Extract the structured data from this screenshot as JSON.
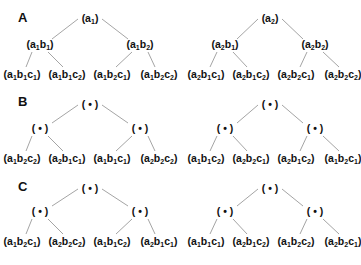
{
  "panels": [
    {
      "label": "A",
      "trees": [
        {
          "root": "(a1)",
          "mid": [
            "(a1b1)",
            "(a1b2)"
          ],
          "leaves": [
            "(a1b1c1)",
            "(a1b1c2)",
            "(a1b2c1)",
            "(a1b2c2)"
          ]
        },
        {
          "root": "(a2)",
          "mid": [
            "(a2b1)",
            "(a2b2)"
          ],
          "leaves": [
            "(a2b1c1)",
            "(a2b1c2)",
            "(a2b2c1)",
            "(a2b2c2)"
          ]
        }
      ]
    },
    {
      "label": "B",
      "trees": [
        {
          "root": "(•)",
          "mid": [
            "(•)",
            "(•)"
          ],
          "leaves": [
            "(a1b2c2)",
            "(a2b1c1)",
            "(a1b1c1)",
            "(a2b2c2)"
          ]
        },
        {
          "root": "(•)",
          "mid": [
            "(•)",
            "(•)"
          ],
          "leaves": [
            "(a1b1c2)",
            "(a2b2c1)",
            "(a2b1c2)",
            "(a1b2c1)"
          ]
        }
      ]
    },
    {
      "label": "C",
      "trees": [
        {
          "root": "(•)",
          "mid": [
            "(•)",
            "(•)"
          ],
          "leaves": [
            "(a1b2c1)",
            "(a2b2c2)",
            "(a1b1c2)",
            "(a2b1c1)"
          ]
        },
        {
          "root": "(•)",
          "mid": [
            "(•)",
            "(•)"
          ],
          "leaves": [
            "(a1b1c1)",
            "(a2b1c2)",
            "(a1b2c2)",
            "(a2b2c1)"
          ]
        }
      ]
    }
  ],
  "colors": {
    "text": "#111111",
    "edge": "#9a9a9a",
    "background": "#ffffff"
  }
}
